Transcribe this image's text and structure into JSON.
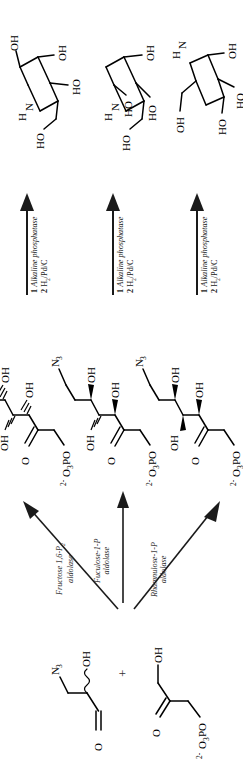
{
  "scheme": {
    "title": "Aldolase-catalyzed synthesis of iminocyclitols",
    "orientation": "rotated-90",
    "background_color": "#ffffff",
    "ink_color": "#000000"
  },
  "substrates": {
    "aldehyde": {
      "name": "3-azido-2-hydroxypropanal",
      "labels": {
        "carbonyl_o": "O",
        "hydroxyl": "OH",
        "azide": "N",
        "azide_sub": "3"
      },
      "stereo_note": "wavy bond (racemic / undefined stereocenter)"
    },
    "plus_symbol": "+",
    "dhap": {
      "name": "dihydroxyacetone phosphate",
      "labels": {
        "carbonyl_o": "O",
        "hydroxyl": "OH",
        "phosphate": "O",
        "phosphate_sub": "3",
        "phosphate_tail": "PO",
        "phosphate_charge": "2-"
      }
    }
  },
  "enzymes": [
    {
      "id": "fba",
      "line1": "Fructose 1,6-P",
      "line1_sub": "2",
      "line2": "aldolase"
    },
    {
      "id": "fuca",
      "line1": "Fuculose-1-P",
      "line1_sub": "",
      "line2": "aldolase"
    },
    {
      "id": "rhua",
      "line1": "Rhamnulose-1-P",
      "line1_sub": "",
      "line2": "aldolase"
    }
  ],
  "intermediates": [
    {
      "id": "azido-ketose-1",
      "labels": {
        "azide": "N",
        "azide_sub": "3",
        "oh_top": "OH",
        "oh_left": "OH",
        "oh_bottom": "OH",
        "carbonyl": "O",
        "phos": "O",
        "phos_sub": "3",
        "phos_tail": "PO",
        "phos_charge": "2-"
      },
      "stereo": [
        "hash",
        "hash",
        "hash"
      ]
    },
    {
      "id": "azido-ketose-2",
      "labels": {
        "azide": "N",
        "azide_sub": "3",
        "oh_top": "OH",
        "oh_left": "OH",
        "oh_bottom": "OH",
        "carbonyl": "O",
        "phos": "O",
        "phos_sub": "3",
        "phos_tail": "PO",
        "phos_charge": "2-"
      },
      "stereo": [
        "wedge",
        "hash",
        "wedge"
      ]
    },
    {
      "id": "azido-ketose-3",
      "labels": {
        "azide": "N",
        "azide_sub": "3",
        "oh_top": "OH",
        "oh_left": "OH",
        "oh_bottom": "OH",
        "carbonyl": "O",
        "phos": "O",
        "phos_sub": "3",
        "phos_tail": "PO",
        "phos_charge": "2-"
      },
      "stereo": [
        "wedge",
        "wedge",
        "wedge"
      ]
    }
  ],
  "reaction_conditions": {
    "step1_number": "1",
    "step1_reagent": "Alkaline phosphatase",
    "step2_number": "2",
    "step2_reagent_pre": "H",
    "step2_reagent_sub": "2",
    "step2_reagent_post": "/Pd/C"
  },
  "products": [
    {
      "id": "iminocyclitol-1",
      "labels": {
        "nh_h": "H",
        "nh_n": "N",
        "oh_a": "OH",
        "oh_b": "OH",
        "oh_c": "HO",
        "oh_d": "HO"
      }
    },
    {
      "id": "iminocyclitol-2",
      "labels": {
        "nh_h": "H",
        "nh_n": "N",
        "oh_a": "HO",
        "oh_b": "OH",
        "oh_c": "HO",
        "oh_d": "HO"
      }
    },
    {
      "id": "iminocyclitol-3",
      "labels": {
        "nh_h": "H",
        "nh_n": "N",
        "oh_a": "OH",
        "oh_b": "HO",
        "oh_c": "HO",
        "oh_d": "OH"
      }
    }
  ]
}
